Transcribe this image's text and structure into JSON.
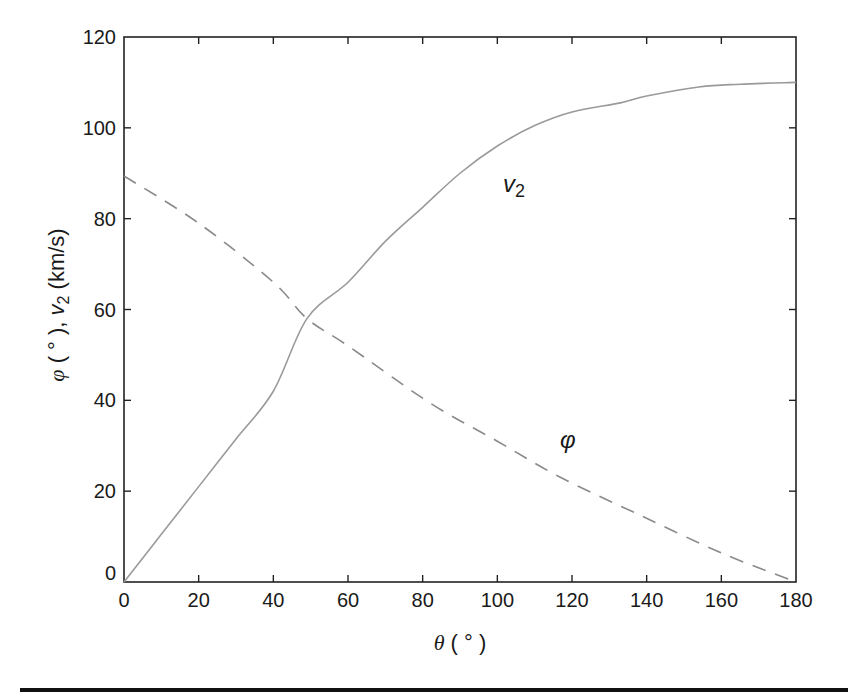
{
  "chart_data": {
    "type": "line",
    "title": "",
    "xlabel": "θ ( ° )",
    "ylabel": "φ ( ° ), v2 (km/s)",
    "xlim": [
      0,
      180
    ],
    "ylim": [
      0,
      120
    ],
    "x_ticks": [
      0,
      20,
      40,
      60,
      80,
      100,
      120,
      140,
      160,
      180
    ],
    "y_ticks": [
      0,
      20,
      40,
      60,
      80,
      100,
      120
    ],
    "grid": false,
    "legend": "none (inline curve labels)",
    "series": [
      {
        "name": "v2",
        "label": "v2",
        "style": "solid",
        "color": "#9a9a9a",
        "x": [
          0,
          10,
          20,
          30,
          40,
          49,
          60,
          70,
          80,
          90,
          100,
          110,
          120,
          133,
          140,
          154,
          165,
          180
        ],
        "y": [
          0,
          10.5,
          21,
          31.5,
          42,
          58,
          66,
          75,
          82.5,
          90,
          96,
          100.5,
          103.5,
          105.5,
          107,
          109,
          109.6,
          110
        ]
      },
      {
        "name": "phi",
        "label": "φ",
        "style": "dashed",
        "color": "#8a8a8a",
        "x": [
          0,
          20,
          40,
          49,
          60,
          82,
          100,
          117,
          138,
          160,
          180
        ],
        "y": [
          89.4,
          79,
          66,
          58,
          52,
          39.4,
          31,
          23,
          14.8,
          6.4,
          0
        ]
      }
    ],
    "annotations": [
      {
        "text": "v2",
        "x": 107,
        "y": 85
      },
      {
        "text": "φ",
        "x": 118,
        "y": 31
      }
    ]
  },
  "labels": {
    "y_title_phi": "φ",
    "y_title_deg": " ( ° ), ",
    "y_title_v": "v",
    "y_title_sub": "2",
    "y_title_units": " (km/s)",
    "x_title_theta": "θ",
    "x_title_deg": " ( ° )",
    "anno_v": "v",
    "anno_v_sub": "2",
    "anno_phi": "φ"
  }
}
